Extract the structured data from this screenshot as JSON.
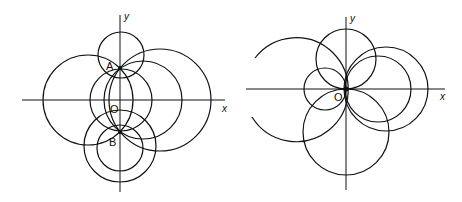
{
  "left_figure": {
    "axis_labels": {
      "x": "x",
      "y": "y"
    },
    "point_labels": {
      "A": "A",
      "B": "B",
      "O": "O"
    },
    "points": {
      "A": [
        120,
        68
      ],
      "B": [
        120,
        132
      ],
      "O": [
        120,
        100
      ]
    }
  },
  "right_figure": {
    "axis_labels": {
      "x": "x",
      "y": "y"
    },
    "point_labels": {
      "O": "O"
    }
  }
}
